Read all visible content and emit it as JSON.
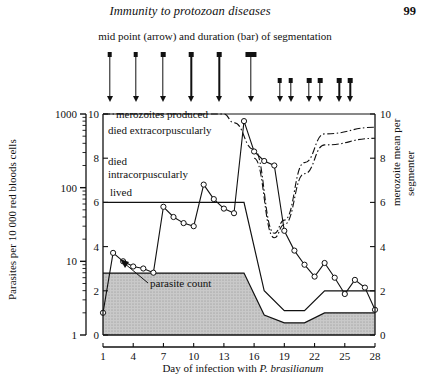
{
  "running_head": {
    "title": "Immunity to protozoan diseases",
    "page_number": "99"
  },
  "annotations": {
    "segmentation_caption": "mid point (arrow) and duration (bar) of segmentation",
    "parasite_count_label": "parasite count",
    "merozoites_produced_label": "merozoites produced",
    "died_extracorpuscularly_label": "died extracorpuscularly",
    "died_line1": "died",
    "died_line2": "intracorpuscularly",
    "lived_label": "lived"
  },
  "axes": {
    "y_left_label": "Parasites per 10 000 red bloods cells",
    "y_left_ticks": [
      "1000",
      "100",
      "10",
      "1"
    ],
    "y_left_scale": "log",
    "y_left_range": [
      1,
      1000
    ],
    "y_right_label_line1": "merozoite mean per",
    "y_right_label_line2": "segmenter",
    "y_right_ticks": [
      "10",
      "8",
      "6",
      "4",
      "2",
      "0"
    ],
    "y_right_range": [
      0,
      10
    ],
    "y_inner_ticks": [
      "10",
      "8",
      "6",
      "4",
      "2",
      "0"
    ],
    "x_label_text": "Day of infection with ",
    "x_label_italic": "P. brasilianum",
    "x_ticks": [
      "1",
      "4",
      "7",
      "10",
      "13",
      "16",
      "19",
      "22",
      "25",
      "28"
    ],
    "x_range": [
      1,
      28
    ]
  },
  "chart_data": {
    "type": "line",
    "xlabel": "Day of infection with P. brasilianum",
    "ylabel": "Parasites per 10 000 red bloods cells",
    "y2label": "merozoite mean per segmenter",
    "xlim": [
      1,
      28
    ],
    "ylim": [
      1,
      1000
    ],
    "y2lim": [
      0,
      10
    ],
    "grid": false,
    "series": [
      {
        "name": "parasite count",
        "axis": "left",
        "marker": "open-circle",
        "x": [
          1,
          2,
          3,
          4,
          5,
          6,
          7,
          8,
          9,
          10,
          11,
          12,
          13,
          14,
          15,
          16,
          17,
          18,
          19,
          20,
          21,
          22,
          23,
          24,
          25,
          26,
          27,
          28
        ],
        "y": [
          2.0,
          13.0,
          10.0,
          8.5,
          8.0,
          7.0,
          55.0,
          40.0,
          33.0,
          30.0,
          110.0,
          70.0,
          52.0,
          45.0,
          800.0,
          310.0,
          230.0,
          200.0,
          26.0,
          14.0,
          9.0,
          6.2,
          9.5,
          6.0,
          3.6,
          5.6,
          4.4,
          2.2
        ]
      },
      {
        "name": "merozoites produced",
        "axis": "right",
        "style": "dash-dot",
        "x": [
          1,
          13,
          14,
          16,
          18,
          19,
          21,
          23,
          28
        ],
        "y": [
          10.0,
          10.0,
          9.6,
          8.4,
          4.6,
          5.2,
          7.8,
          9.1,
          9.4
        ]
      },
      {
        "name": "merozoites produced (lower trace)",
        "axis": "right",
        "style": "dash-dot",
        "x": [
          16,
          18,
          19,
          21,
          23,
          28
        ],
        "y": [
          8.0,
          4.4,
          5.0,
          7.3,
          8.6,
          8.9
        ]
      },
      {
        "name": "died extracorpuscularly (upper boundary)",
        "axis": "right",
        "style": "solid",
        "x": [
          1,
          15,
          17,
          19,
          21,
          23,
          28
        ],
        "y": [
          6.0,
          6.0,
          2.0,
          1.1,
          1.1,
          2.0,
          2.0
        ]
      },
      {
        "name": "died intracorpuscularly (boundary)",
        "axis": "right",
        "style": "solid",
        "x": [
          1,
          15,
          17,
          19,
          21,
          23,
          28
        ],
        "y": [
          2.8,
          2.8,
          0.9,
          0.55,
          0.55,
          1.0,
          1.0
        ]
      },
      {
        "name": "lived (shaded band base)",
        "axis": "right",
        "style": "solid-filled",
        "x": [
          1,
          28
        ],
        "y": [
          0.0,
          0.0
        ]
      }
    ],
    "segmentation_markers": [
      {
        "day": 1.6,
        "type": "arrow",
        "duration": 0
      },
      {
        "day": 4.2,
        "type": "arrow",
        "duration": 0
      },
      {
        "day": 6.9,
        "type": "arrow",
        "duration": 0
      },
      {
        "day": 9.7,
        "type": "arrow",
        "duration": 0
      },
      {
        "day": 12.5,
        "type": "arrow",
        "duration": 0
      },
      {
        "day": 15.6,
        "type": "bar",
        "duration": 1.1
      },
      {
        "day": 18.5,
        "type": "arrow-short",
        "duration": 0
      },
      {
        "day": 19.6,
        "type": "arrow-short",
        "duration": 0
      },
      {
        "day": 21.4,
        "type": "arrow-short",
        "duration": 0
      },
      {
        "day": 22.5,
        "type": "arrow-short",
        "duration": 0
      },
      {
        "day": 24.4,
        "type": "arrow-short",
        "duration": 0
      },
      {
        "day": 25.5,
        "type": "arrow-short",
        "duration": 0
      }
    ]
  },
  "colors": {
    "ink": "#111111",
    "band_fill": "#c9c9c9",
    "background": "#ffffff"
  }
}
